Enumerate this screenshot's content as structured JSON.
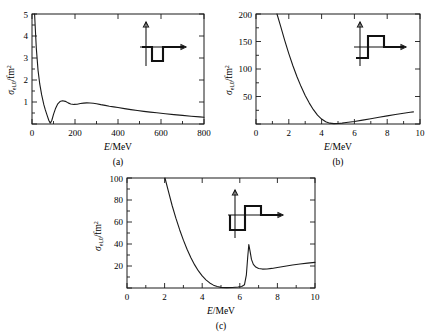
{
  "figure": {
    "background": "#ffffff",
    "ink": "#1a1a1a"
  },
  "panels": [
    {
      "id": "a",
      "caption": "(a)",
      "xlabel_italic": "E",
      "xlabel_rest": "/MeV",
      "ylabel_main": "σ",
      "ylabel_sub": "el,0",
      "ylabel_rest": "/fm",
      "ylabel_sup": "2",
      "xticks": [
        0,
        200,
        400,
        600,
        800
      ],
      "yticks": [
        1,
        2,
        3,
        4,
        5
      ],
      "inset_name": "square-well-potential"
    },
    {
      "id": "b",
      "caption": "(b)",
      "xlabel_italic": "E",
      "xlabel_rest": "/MeV",
      "ylabel_main": "σ",
      "ylabel_sub": "el,0",
      "ylabel_rest": "/fm",
      "ylabel_sup": "2",
      "xticks": [
        0,
        2,
        4,
        6,
        8,
        10
      ],
      "yticks": [
        50,
        100,
        150,
        200
      ],
      "inset_name": "well-plus-barrier-potential"
    },
    {
      "id": "c",
      "caption": "(c)",
      "xlabel_italic": "E",
      "xlabel_rest": "/MeV",
      "ylabel_main": "σ",
      "ylabel_sub": "el,0",
      "ylabel_rest": "/fm",
      "ylabel_sup": "2",
      "xticks": [
        0,
        2,
        4,
        6,
        8,
        10
      ],
      "yticks": [
        20,
        40,
        60,
        80,
        100
      ],
      "inset_name": "well-plus-high-barrier-potential"
    }
  ],
  "chart_data": [
    {
      "type": "line",
      "panel": "a",
      "title": "",
      "xlabel": "E/MeV",
      "ylabel": "σ_el,0/fm²",
      "xlim": [
        0,
        800
      ],
      "ylim": [
        0,
        5
      ],
      "xticks": [
        0,
        200,
        400,
        600,
        800
      ],
      "yticks": [
        1,
        2,
        3,
        4,
        5
      ],
      "minor_xtick_step": 100,
      "minor_ytick_step": 0.5,
      "grid": false,
      "legend": null,
      "series": [
        {
          "name": "sigma_el_0",
          "x": [
            12,
            20,
            28,
            36,
            45,
            55,
            62,
            70,
            78,
            85,
            92,
            100,
            110,
            120,
            130,
            142,
            155,
            168,
            180,
            195,
            210,
            225,
            240,
            255,
            270,
            285,
            300,
            320,
            340,
            360,
            380,
            400,
            430,
            460,
            490,
            520,
            550,
            580,
            620,
            660,
            700,
            740,
            780,
            800
          ],
          "y": [
            5.0,
            3.45,
            2.45,
            1.82,
            1.32,
            0.88,
            0.64,
            0.4,
            0.17,
            0.04,
            0.16,
            0.44,
            0.72,
            0.92,
            1.02,
            1.06,
            1.03,
            0.96,
            0.91,
            0.89,
            0.9,
            0.93,
            0.95,
            0.96,
            0.955,
            0.94,
            0.92,
            0.88,
            0.845,
            0.81,
            0.78,
            0.75,
            0.7,
            0.655,
            0.615,
            0.575,
            0.54,
            0.51,
            0.465,
            0.425,
            0.39,
            0.355,
            0.325,
            0.31
          ]
        }
      ],
      "inset": {
        "name": "square-well-potential",
        "description": "Square well: potential drops below axis over a finite width then returns to zero"
      }
    },
    {
      "type": "line",
      "panel": "b",
      "title": "",
      "xlabel": "E/MeV",
      "ylabel": "σ_el,0/fm²",
      "xlim": [
        0,
        10
      ],
      "ylim": [
        0,
        200
      ],
      "xticks": [
        0,
        2,
        4,
        6,
        8,
        10
      ],
      "yticks": [
        50,
        100,
        150,
        200
      ],
      "minor_xtick_step": 1,
      "minor_ytick_step": 25,
      "grid": false,
      "legend": null,
      "series": [
        {
          "name": "sigma_el_0",
          "x": [
            1.28,
            1.5,
            1.75,
            2.0,
            2.25,
            2.5,
            2.75,
            3.0,
            3.25,
            3.5,
            3.75,
            4.0,
            4.25,
            4.5,
            4.75,
            5.0,
            5.25,
            5.5,
            5.75,
            6.0,
            6.5,
            7.0,
            7.5,
            8.0,
            8.5,
            9.0,
            9.4,
            9.6
          ],
          "y": [
            200,
            178,
            152,
            128,
            106,
            86,
            68,
            52,
            38,
            26,
            16,
            9,
            4,
            1.5,
            0.6,
            0.8,
            1.6,
            2.6,
            3.6,
            4.6,
            7.0,
            9.6,
            12.2,
            14.8,
            17.3,
            19.6,
            21.3,
            22.0
          ]
        }
      ],
      "inset": {
        "name": "well-plus-barrier-potential",
        "description": "Square well followed by a raised barrier step above the axis"
      }
    },
    {
      "type": "line",
      "panel": "c",
      "title": "",
      "xlabel": "E/MeV",
      "ylabel": "σ_el,0/fm²",
      "xlim": [
        0,
        10
      ],
      "ylim": [
        0,
        100
      ],
      "xticks": [
        0,
        2,
        4,
        6,
        8,
        10
      ],
      "yticks": [
        20,
        40,
        60,
        80,
        100
      ],
      "minor_xtick_step": 1,
      "minor_ytick_step": 10,
      "grid": false,
      "legend": null,
      "series": [
        {
          "name": "sigma_el_0",
          "x": [
            2.02,
            2.2,
            2.4,
            2.6,
            2.8,
            3.0,
            3.2,
            3.4,
            3.6,
            3.8,
            4.0,
            4.2,
            4.4,
            4.6,
            4.8,
            5.0,
            5.3,
            5.6,
            5.9,
            6.1,
            6.25,
            6.35,
            6.42,
            6.48,
            6.55,
            6.62,
            6.72,
            6.85,
            7.0,
            7.2,
            7.45,
            7.7,
            8.0,
            8.4,
            8.8,
            9.2,
            9.6,
            10.0
          ],
          "y": [
            100,
            88,
            75,
            63.5,
            53,
            43.5,
            35,
            27.5,
            21,
            15.5,
            11,
            7.4,
            4.6,
            2.6,
            1.3,
            0.6,
            0.3,
            0.5,
            0.9,
            1.4,
            3.0,
            12.0,
            28.0,
            39.5,
            33.0,
            26.0,
            21.5,
            19.0,
            17.8,
            17.2,
            17.3,
            17.8,
            18.6,
            19.8,
            20.9,
            21.8,
            22.6,
            23.3
          ]
        }
      ],
      "resonance": {
        "energy_mev": 6.48,
        "peak_value": 39.5
      },
      "inset": {
        "name": "well-plus-high-barrier-potential",
        "description": "Square well followed by a tall barrier step above the axis"
      }
    }
  ]
}
